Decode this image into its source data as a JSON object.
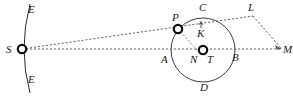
{
  "figure": {
    "type": "geometric-diagram",
    "title": "",
    "background_color": "#ffffff",
    "stroke_color": "#2b2b2b",
    "width": 293,
    "height": 97
  },
  "labels": {
    "e_top": "E",
    "e_bottom": "E",
    "s": "S",
    "p": "P",
    "c": "C",
    "l": "L",
    "k": "K",
    "a": "A",
    "n": "N",
    "t": "T",
    "b": "B",
    "d": "D",
    "m": "M"
  },
  "points": {
    "s": {
      "x": 22,
      "y": 49,
      "marker": "ring"
    },
    "p": {
      "x": 178,
      "y": 29,
      "marker": "ring"
    },
    "t": {
      "x": 203,
      "y": 50,
      "marker": "ring"
    },
    "n": {
      "x": 196,
      "y": 50,
      "marker": "none"
    },
    "k": {
      "x": 201,
      "y": 31,
      "marker": "none"
    },
    "l": {
      "x": 253,
      "y": 16,
      "marker": "none"
    },
    "m": {
      "x": 283,
      "y": 49,
      "marker": "arrow"
    },
    "a": {
      "x": 171,
      "y": 50,
      "marker": "none"
    },
    "b": {
      "x": 235,
      "y": 50,
      "marker": "none"
    },
    "c": {
      "x": 203,
      "y": 18,
      "marker": "none"
    },
    "d": {
      "x": 203,
      "y": 82,
      "marker": "none"
    }
  },
  "shapes": {
    "circle": {
      "cx": 203,
      "cy": 50,
      "r": 32,
      "style": "solid"
    },
    "arc_e": {
      "description": "vertical arc through S",
      "style": "solid"
    },
    "line_s_p": {
      "style": "dashed"
    },
    "line_s_m": {
      "style": "dashed"
    },
    "line_p_l": {
      "style": "dashed"
    },
    "line_l_m": {
      "style": "dashed"
    },
    "line_p_n": {
      "style": "dashed"
    },
    "line_k_tick": {
      "style": "solid"
    }
  }
}
